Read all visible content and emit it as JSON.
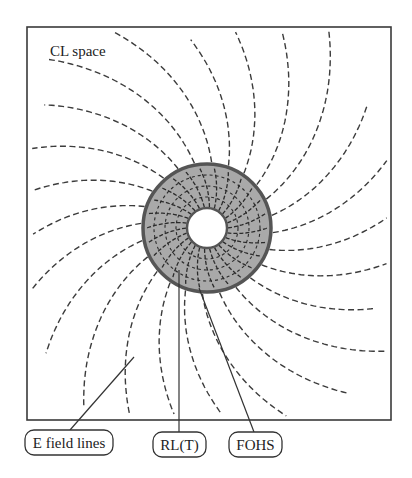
{
  "figure": {
    "title": "CL space",
    "frame": {
      "x": 27,
      "y": 27,
      "width": 364,
      "height": 393
    },
    "colors": {
      "ring_fill": "#a9a9a9",
      "ring_border": "#555555",
      "lines": "#3c3c3c",
      "background": "#ffffff"
    },
    "ring": {
      "center": [
        207,
        228
      ],
      "outer_radius": 64,
      "inner_radius": 20,
      "spoke_count": 26,
      "inner_circle_radii": [
        31,
        42,
        53
      ]
    },
    "field_lines": {
      "count": 24,
      "spiral_rate": 0.0034,
      "start_angle_offset_deg": 4,
      "lengths": [
        150,
        135,
        160,
        120,
        165,
        150,
        140,
        155,
        130,
        165,
        150,
        140,
        165,
        150,
        130,
        150,
        140,
        165,
        150,
        125,
        160,
        145,
        165,
        135
      ]
    },
    "labels": [
      {
        "id": "e-field-lines",
        "text": "E field lines",
        "box": {
          "x": 25,
          "y": 430,
          "width": 88,
          "height": 25
        },
        "leader": [
          [
            70,
            430
          ],
          [
            134,
            357
          ]
        ]
      },
      {
        "id": "rl-t",
        "text": "RL(T)",
        "box": {
          "x": 153,
          "y": 432,
          "width": 53,
          "height": 25
        },
        "leader": [
          [
            179,
            432
          ],
          [
            179,
            270
          ]
        ]
      },
      {
        "id": "fohs",
        "text": "FOHS",
        "box": {
          "x": 229,
          "y": 432,
          "width": 53,
          "height": 25
        },
        "leader": [
          [
            254,
            432
          ],
          [
            199,
            288
          ]
        ]
      }
    ]
  }
}
